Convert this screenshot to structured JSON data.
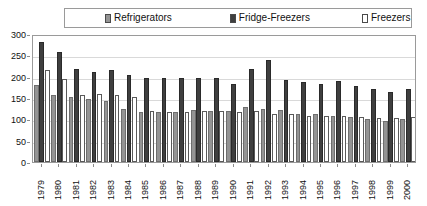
{
  "chart_data": {
    "type": "bar",
    "title": "",
    "subtitle": "",
    "xlabel": "",
    "ylabel": "",
    "ylim": [
      0,
      300
    ],
    "yticks": [
      0,
      50,
      100,
      150,
      200,
      250,
      300
    ],
    "ytick_labels": [
      "0",
      "50",
      "100",
      "150",
      "200",
      "250",
      "300"
    ],
    "grid": true,
    "legend_position": "top",
    "categories": [
      "1979",
      "1980",
      "1981",
      "1982",
      "1983",
      "1984",
      "1985",
      "1986",
      "1987",
      "1988",
      "1989",
      "1990",
      "1991",
      "1992",
      "1993",
      "1994",
      "1995",
      "1996",
      "1997",
      "1998",
      "1999",
      "2000"
    ],
    "series": [
      {
        "name": "Refrigerators",
        "color": "#949494",
        "border": "#6e6e6e",
        "values": [
          180,
          157,
          152,
          147,
          143,
          125,
          118,
          118,
          117,
          122,
          120,
          120,
          130,
          125,
          122,
          112,
          112,
          108,
          105,
          100,
          95,
          100
        ]
      },
      {
        "name": "Fridge-Freezers",
        "color": "#3f3f3f",
        "border": "#2a2a2a",
        "values": [
          282,
          257,
          218,
          212,
          216,
          205,
          197,
          197,
          197,
          196,
          196,
          183,
          218,
          240,
          192,
          187,
          182,
          190,
          178,
          172,
          165,
          172
        ]
      },
      {
        "name": "Freezers",
        "color": "#ffffff",
        "border": "#5a5a5a",
        "values": [
          215,
          195,
          157,
          160,
          158,
          152,
          120,
          118,
          118,
          120,
          120,
          118,
          120,
          112,
          112,
          108,
          107,
          108,
          105,
          102,
          102,
          105
        ]
      }
    ]
  },
  "legend": {
    "items": [
      {
        "label": "Refrigerators",
        "swatch": "#949494",
        "icon": "legend-swatch-icon"
      },
      {
        "label": "Fridge-Freezers",
        "swatch": "#3f3f3f",
        "icon": "legend-swatch-icon"
      },
      {
        "label": "Freezers",
        "swatch": "#ffffff",
        "icon": "legend-swatch-icon"
      }
    ]
  },
  "colors": {
    "refrigerators": "#949494",
    "fridge_freezers": "#3f3f3f",
    "freezers": "#ffffff",
    "frame": "#9a9a9a",
    "gridline": "#d9d9d9",
    "text": "#111111",
    "background": "#ffffff"
  }
}
